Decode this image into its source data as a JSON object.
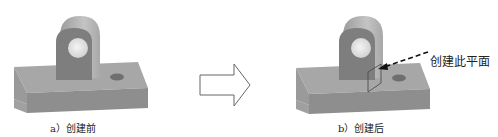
{
  "figure": {
    "left": {
      "caption": "a）创建前",
      "label_meaning": "before creation"
    },
    "transition": {
      "icon": "right-arrow-icon"
    },
    "right": {
      "caption": "b）创建后",
      "callout": "创建此平面"
    }
  },
  "colors": {
    "part_top": "#a9a9a9",
    "part_front": "#8c8c8c",
    "boss_face": "#7f7f7f",
    "boss_top": "#b8b8b8",
    "hole": "#e6e6e6",
    "plane_outline": "#555555",
    "arrow_outline": "#555555",
    "text": "#222222"
  }
}
